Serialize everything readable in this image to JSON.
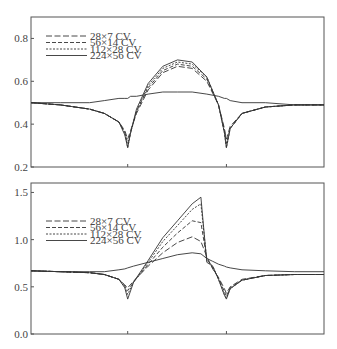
{
  "chart_data": [
    {
      "type": "line",
      "title": "",
      "xlabel": "",
      "ylabel": "",
      "ylim": [
        0.2,
        0.9
      ],
      "yticks": [
        "0.2",
        "0.4",
        "0.6",
        "0.8"
      ],
      "xticks_at_fraction": [
        0.33,
        0.667
      ],
      "grid": false,
      "legend_position": "upper left",
      "legend": [
        "28×7 CV",
        "56×14 CV",
        "112×28 CV",
        "224×56 CV"
      ],
      "x": [
        0,
        0.1,
        0.2,
        0.25,
        0.3,
        0.32,
        0.33,
        0.34,
        0.36,
        0.4,
        0.45,
        0.5,
        0.55,
        0.6,
        0.64,
        0.66,
        0.667,
        0.68,
        0.72,
        0.8,
        0.9,
        1.0
      ],
      "series": [
        {
          "name": "28×7 CV",
          "style": "dashed-long",
          "values": [
            0.5,
            0.49,
            0.47,
            0.45,
            0.41,
            0.37,
            0.33,
            0.37,
            0.45,
            0.56,
            0.64,
            0.67,
            0.66,
            0.6,
            0.49,
            0.38,
            0.33,
            0.39,
            0.45,
            0.48,
            0.49,
            0.49
          ]
        },
        {
          "name": "56×14 CV",
          "style": "dashed-medium",
          "values": [
            0.5,
            0.49,
            0.47,
            0.45,
            0.41,
            0.36,
            0.31,
            0.36,
            0.46,
            0.57,
            0.65,
            0.68,
            0.67,
            0.61,
            0.49,
            0.37,
            0.31,
            0.38,
            0.45,
            0.48,
            0.49,
            0.49
          ]
        },
        {
          "name": "112×28 CV",
          "style": "dotted-short",
          "values": [
            0.5,
            0.49,
            0.47,
            0.45,
            0.41,
            0.36,
            0.29,
            0.36,
            0.46,
            0.58,
            0.66,
            0.69,
            0.68,
            0.62,
            0.49,
            0.36,
            0.29,
            0.38,
            0.45,
            0.48,
            0.49,
            0.49
          ]
        },
        {
          "name": "224×56 CV",
          "style": "solid",
          "values": [
            0.5,
            0.5,
            0.5,
            0.51,
            0.52,
            0.52,
            0.52,
            0.53,
            0.53,
            0.54,
            0.55,
            0.55,
            0.55,
            0.54,
            0.53,
            0.52,
            0.52,
            0.51,
            0.5,
            0.5,
            0.49,
            0.49
          ]
        },
        {
          "name": "224×56 CV (converging branch)",
          "style": "solid",
          "values": [
            0.5,
            0.49,
            0.47,
            0.45,
            0.41,
            0.35,
            0.29,
            0.36,
            0.47,
            0.59,
            0.67,
            0.7,
            0.69,
            0.62,
            0.49,
            0.36,
            0.29,
            0.38,
            0.45,
            0.48,
            0.49,
            0.49
          ]
        }
      ]
    },
    {
      "type": "line",
      "title": "",
      "xlabel": "",
      "ylabel": "",
      "ylim": [
        0.0,
        1.6
      ],
      "yticks": [
        "0.0",
        "0.5",
        "1.0",
        "1.5"
      ],
      "xticks_at_fraction": [
        0.33,
        0.667
      ],
      "grid": false,
      "legend_position": "upper left",
      "legend": [
        "28×7 CV",
        "56×14 CV",
        "112×28 CV",
        "224×56 CV"
      ],
      "x": [
        0,
        0.1,
        0.2,
        0.25,
        0.3,
        0.32,
        0.33,
        0.35,
        0.4,
        0.45,
        0.5,
        0.55,
        0.58,
        0.6,
        0.62,
        0.64,
        0.66,
        0.667,
        0.68,
        0.72,
        0.8,
        0.9,
        1.0
      ],
      "series": [
        {
          "name": "28×7 CV",
          "style": "dashed-long",
          "values": [
            0.67,
            0.66,
            0.65,
            0.63,
            0.58,
            0.52,
            0.49,
            0.56,
            0.72,
            0.86,
            0.97,
            1.03,
            0.98,
            0.82,
            0.69,
            0.6,
            0.48,
            0.43,
            0.5,
            0.58,
            0.62,
            0.63,
            0.63
          ]
        },
        {
          "name": "56×14 CV",
          "style": "dashed-medium",
          "values": [
            0.67,
            0.66,
            0.65,
            0.63,
            0.58,
            0.51,
            0.46,
            0.55,
            0.74,
            0.92,
            1.07,
            1.2,
            1.18,
            0.8,
            0.7,
            0.59,
            0.45,
            0.4,
            0.49,
            0.57,
            0.62,
            0.63,
            0.63
          ]
        },
        {
          "name": "112×28 CV",
          "style": "dotted-short",
          "values": [
            0.67,
            0.66,
            0.65,
            0.63,
            0.58,
            0.5,
            0.42,
            0.55,
            0.76,
            0.98,
            1.15,
            1.32,
            1.38,
            0.78,
            0.72,
            0.58,
            0.42,
            0.38,
            0.48,
            0.57,
            0.62,
            0.63,
            0.63
          ]
        },
        {
          "name": "224×56 CV",
          "style": "solid",
          "values": [
            0.67,
            0.66,
            0.66,
            0.66,
            0.68,
            0.69,
            0.7,
            0.72,
            0.76,
            0.8,
            0.84,
            0.86,
            0.85,
            0.8,
            0.77,
            0.74,
            0.72,
            0.71,
            0.7,
            0.68,
            0.67,
            0.66,
            0.66
          ]
        },
        {
          "name": "224×56 CV (converging branch)",
          "style": "solid",
          "values": [
            0.67,
            0.66,
            0.65,
            0.63,
            0.58,
            0.49,
            0.37,
            0.55,
            0.78,
            1.02,
            1.2,
            1.38,
            1.45,
            0.76,
            0.72,
            0.58,
            0.41,
            0.37,
            0.48,
            0.57,
            0.62,
            0.63,
            0.63
          ]
        }
      ]
    }
  ],
  "colors": {
    "axis": "#555555",
    "line": "#333333",
    "text": "#444444"
  }
}
